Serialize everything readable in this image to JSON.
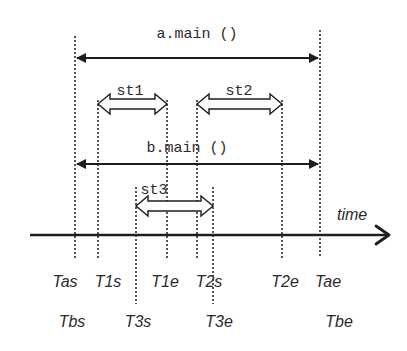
{
  "diagram": {
    "axis": {
      "label": "time",
      "y": 235,
      "x_start": 30,
      "x_end": 390
    },
    "markers": [
      {
        "name": "Tas",
        "x": 75,
        "y_top": 36,
        "y_bottom": 258
      },
      {
        "name": "T1s",
        "x": 98,
        "y_top": 100,
        "y_bottom": 258
      },
      {
        "name": "T3s",
        "x": 136,
        "y_top": 187,
        "y_bottom": 304
      },
      {
        "name": "T1e",
        "x": 167,
        "y_top": 100,
        "y_bottom": 258
      },
      {
        "name": "T2s",
        "x": 197,
        "y_top": 100,
        "y_bottom": 258
      },
      {
        "name": "T3e",
        "x": 213,
        "y_top": 187,
        "y_bottom": 304
      },
      {
        "name": "T2e",
        "x": 282,
        "y_top": 100,
        "y_bottom": 258
      },
      {
        "name": "Tae",
        "x": 320,
        "y_top": 30,
        "y_bottom": 258
      }
    ],
    "spans": {
      "a_main": {
        "label": "a.main ()",
        "x1": 75,
        "x2": 320,
        "y": 58
      },
      "b_main": {
        "label": "b.main ()",
        "x1": 75,
        "x2": 320,
        "y": 164
      },
      "st1": {
        "label": "st1",
        "x1": 98,
        "x2": 167,
        "y": 104
      },
      "st2": {
        "label": "st2",
        "x1": 197,
        "x2": 282,
        "y": 104
      },
      "st3": {
        "label": "st3",
        "x1": 136,
        "x2": 213,
        "y": 206
      }
    },
    "labels_row1": [
      "Tas",
      "T1s",
      "T1e",
      "T2s",
      "T2e",
      "Tae"
    ],
    "labels_row2": [
      "Tbs",
      "T3s",
      "T3e",
      "Tbe"
    ],
    "colors": {
      "ink": "#1e1e1e",
      "background": "#ffffff"
    }
  }
}
